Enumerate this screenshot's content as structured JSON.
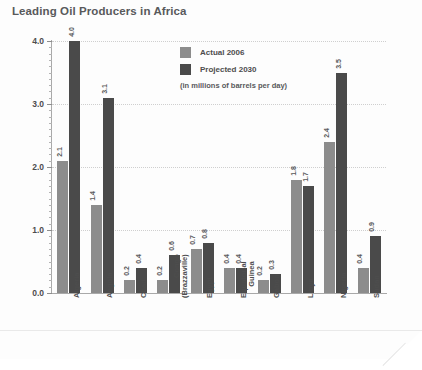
{
  "chart_data": {
    "type": "bar",
    "title": "Leading Oil Producers in Africa",
    "subtitle": "(in millions of barrels per day)",
    "xlabel": "",
    "ylabel": "",
    "ylim": [
      0,
      4.0
    ],
    "ytick_labels": [
      "0.0",
      "1.0",
      "2.0",
      "3.0",
      "4.0"
    ],
    "ytick_values": [
      0,
      1,
      2,
      3,
      4
    ],
    "minor_tick_step": 0.1,
    "grid": true,
    "legend_position": "inside-top-center",
    "categories": [
      "Algeria",
      "Angola",
      "Chad",
      "Congo\n(Brazzaville)",
      "Egypt",
      "Equatorial\nGuinea",
      "Gabon",
      "Libya",
      "Nigeria",
      "Sudan"
    ],
    "series": [
      {
        "name": "Actual 2006",
        "color": "#8c8c8c",
        "values": [
          2.1,
          1.4,
          0.2,
          0.2,
          0.7,
          0.4,
          0.2,
          1.8,
          2.4,
          0.4
        ],
        "labels": [
          "2.1",
          "1.4",
          "0.2",
          "0.2",
          "0.7",
          "0.4",
          "0.2",
          "1.8",
          "2.4",
          "0.4"
        ]
      },
      {
        "name": "Projected 2030",
        "color": "#4a4a4a",
        "values": [
          4.0,
          3.1,
          0.4,
          0.6,
          0.8,
          0.4,
          0.3,
          1.7,
          3.5,
          0.9
        ],
        "labels": [
          "4.0",
          "3.1",
          "0.4",
          "0.6",
          "0.8",
          "0.4",
          "0.3",
          "1.7",
          "3.5",
          "0.9"
        ]
      }
    ]
  },
  "colors": {
    "title": "#58595b",
    "axis": "#a9a9a9",
    "grid": "#cfcfcf",
    "actual": "#8c8c8c",
    "projected": "#4a4a4a",
    "page": "#ffffff"
  }
}
